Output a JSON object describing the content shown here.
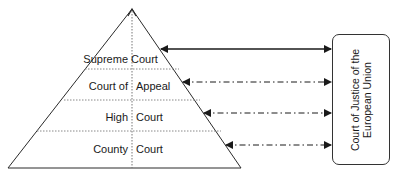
{
  "diagram": {
    "levels": [
      {
        "left": "Supreme",
        "right": "Court",
        "label": "Supreme Court"
      },
      {
        "left": "Court of",
        "right": "Appeal",
        "label": "Court of Appeal"
      },
      {
        "left": "High",
        "right": "Court",
        "label": "High Court"
      },
      {
        "left": "County",
        "right": "Court",
        "label": "County Court"
      }
    ],
    "external_body": {
      "line1": "Court of Justice of the",
      "line2": "European Union"
    },
    "connections": [
      {
        "from": "Supreme Court",
        "to": "Court of Justice of the European Union",
        "style": "solid"
      },
      {
        "from": "Court of Appeal",
        "to": "Court of Justice of the European Union",
        "style": "dash-dot"
      },
      {
        "from": "High Court",
        "to": "Court of Justice of the European Union",
        "style": "dash-dot"
      },
      {
        "from": "County Court",
        "to": "Court of Justice of the European Union",
        "style": "dash-dot"
      }
    ],
    "colors": {
      "line": "#2a2a2a",
      "divider": "#888888"
    }
  }
}
